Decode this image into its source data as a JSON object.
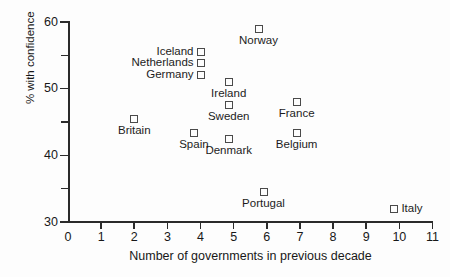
{
  "chart_data": {
    "type": "scatter",
    "title": "",
    "xlabel": "Number of governments in previous decade",
    "ylabel": "% with confidence",
    "xlim": [
      0,
      11
    ],
    "ylim": [
      30,
      60
    ],
    "xticks": [
      0,
      1,
      2,
      3,
      4,
      5,
      6,
      7,
      8,
      9,
      10,
      11
    ],
    "xtick_labels": [
      "0",
      "1",
      "2",
      "3",
      "4",
      "5",
      "6",
      "7",
      "8",
      "9",
      "10",
      "11"
    ],
    "yticks_major": [
      30,
      40,
      50,
      60
    ],
    "ytick_labels": [
      "30",
      "40",
      "50",
      "60"
    ],
    "yticks_minor": [
      35,
      45,
      55
    ],
    "grid": false,
    "legend": "none",
    "marker": "open-square",
    "marker_color": "#4a4a4a",
    "points": [
      {
        "label": "Britain",
        "x": 2,
        "y": 45.5,
        "label_pos": "below"
      },
      {
        "label": "Iceland",
        "x": 4,
        "y": 55.5,
        "label_pos": "left"
      },
      {
        "label": "Netherlands",
        "x": 4,
        "y": 53.8,
        "label_pos": "left"
      },
      {
        "label": "Germany",
        "x": 4,
        "y": 52.0,
        "label_pos": "left"
      },
      {
        "label": "Norway",
        "x": 5.75,
        "y": 59.0,
        "label_pos": "below"
      },
      {
        "label": "Ireland",
        "x": 4.85,
        "y": 51.0,
        "label_pos": "below"
      },
      {
        "label": "Sweden",
        "x": 4.85,
        "y": 47.5,
        "label_pos": "below"
      },
      {
        "label": "Spain",
        "x": 3.8,
        "y": 43.3,
        "label_pos": "below"
      },
      {
        "label": "Denmark",
        "x": 4.85,
        "y": 42.4,
        "label_pos": "below"
      },
      {
        "label": "France",
        "x": 6.9,
        "y": 48.0,
        "label_pos": "below"
      },
      {
        "label": "Belgium",
        "x": 6.9,
        "y": 43.4,
        "label_pos": "below"
      },
      {
        "label": "Portugal",
        "x": 5.9,
        "y": 34.5,
        "label_pos": "below"
      },
      {
        "label": "Italy",
        "x": 9.85,
        "y": 32.0,
        "label_pos": "right"
      }
    ]
  }
}
